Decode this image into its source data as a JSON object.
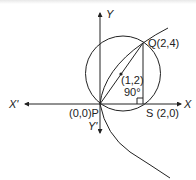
{
  "diagram": {
    "type": "coordinate-geometry",
    "axes": {
      "x_label": "X",
      "x_neg_label": "X'",
      "y_label": "Y",
      "y_neg_label": "Y'"
    },
    "points": {
      "P": {
        "label": "(0,0)P",
        "coords": [
          0,
          0
        ]
      },
      "Q": {
        "label": "Q(2,4)",
        "coords": [
          2,
          4
        ]
      },
      "S": {
        "label": "S (2,0)",
        "coords": [
          2,
          0
        ]
      },
      "center": {
        "label": "(1,2)",
        "coords": [
          1,
          2
        ]
      }
    },
    "angle_label": "90°",
    "curves": [
      "parabola y^2 = 8x",
      "circle through P, Q, S with center (1,2)"
    ],
    "colors": {
      "stroke": "#222222",
      "background": "#ffffff"
    }
  }
}
